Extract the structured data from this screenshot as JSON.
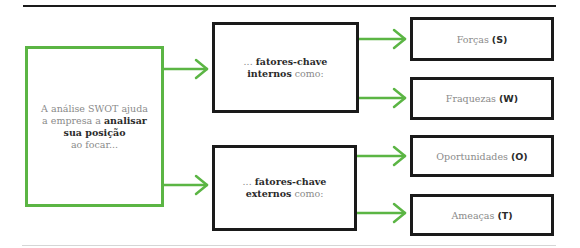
{
  "diagram": {
    "colors": {
      "accent": "#5bb544",
      "box_border": "#1a1a1a",
      "text_light": "#8a8a8a",
      "text_dark": "#2a2a2a"
    },
    "main": {
      "line1": "A análise SWOT ajuda",
      "line2_prefix": "a empresa a ",
      "line2_bold": "analisar",
      "line3_bold": "sua posição",
      "line4": "ao focar..."
    },
    "internal": {
      "prefix": "... ",
      "bold1": "fatores-chave",
      "bold2": "internos",
      "suffix": " como:"
    },
    "external": {
      "prefix": "... ",
      "bold1": "fatores-chave",
      "bold2": "externos",
      "suffix": " como:"
    },
    "items": [
      {
        "label": "Forças ",
        "letter": "(S)"
      },
      {
        "label": "Fraquezas ",
        "letter": "(W)"
      },
      {
        "label": "Oportunidades ",
        "letter": "(O)"
      },
      {
        "label": "Ameaças ",
        "letter": "(T)"
      }
    ],
    "arrow_icon": "arrow-right"
  }
}
